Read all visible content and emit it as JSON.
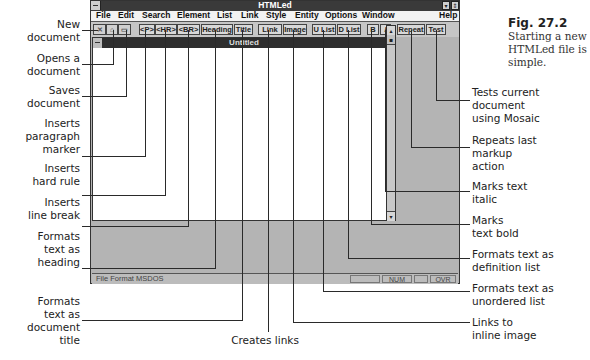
{
  "figure": {
    "number": "Fig. 27.2",
    "caption_lines": [
      "Starting a new",
      "HTMLed file is",
      "simple."
    ]
  },
  "app": {
    "title": "HTMLed",
    "menu": [
      "File",
      "Edit",
      "Search",
      "Element",
      "List",
      "Link",
      "Style",
      "Entity",
      "Options",
      "Window",
      "Help"
    ],
    "toolbar": {
      "new_icon": "new-document-icon",
      "open_icon": "open-document-icon",
      "save_icon": "save-document-icon",
      "buttons": [
        "<P>",
        "<HR>",
        "<BR>",
        "Heading",
        "Title",
        "Link",
        "Image",
        "U List",
        "D List",
        "B",
        "I",
        "Repeat",
        "Test"
      ]
    },
    "document": {
      "title": "Untitled"
    },
    "status": {
      "text": "File Format MSDOS",
      "num": "NUM",
      "ovr": "OVR"
    }
  },
  "callouts": {
    "left": [
      {
        "lines": [
          "New",
          "document"
        ]
      },
      {
        "lines": [
          "Opens a",
          "document"
        ]
      },
      {
        "lines": [
          "Saves",
          "document"
        ]
      },
      {
        "lines": [
          "Inserts",
          "paragraph",
          "marker"
        ]
      },
      {
        "lines": [
          "Inserts",
          "hard rule"
        ]
      },
      {
        "lines": [
          "Inserts",
          "line break"
        ]
      },
      {
        "lines": [
          "Formats",
          "text as",
          "heading"
        ]
      },
      {
        "lines": [
          "Formats",
          "text as",
          "document",
          "title"
        ]
      }
    ],
    "bottom": [
      {
        "lines": [
          "Creates links"
        ]
      }
    ],
    "right": [
      {
        "lines": [
          "Tests current",
          "document",
          "using Mosaic"
        ]
      },
      {
        "lines": [
          "Repeats last",
          "markup",
          "action"
        ]
      },
      {
        "lines": [
          "Marks text",
          "italic"
        ]
      },
      {
        "lines": [
          "Marks",
          "text bold"
        ]
      },
      {
        "lines": [
          "Formats text as",
          "definition list"
        ]
      },
      {
        "lines": [
          "Formats text as",
          "unordered list"
        ]
      },
      {
        "lines": [
          "Links to",
          "inline image"
        ]
      }
    ]
  }
}
